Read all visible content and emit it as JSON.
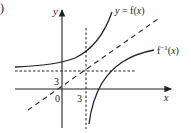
{
  "figure": {
    "part_label": ")",
    "axes": {
      "x_label": "x",
      "y_label": "y",
      "origin_label": "0"
    },
    "ticks": {
      "x_tick": "3",
      "y_tick": "3"
    },
    "curves": {
      "f_label": "y = f(x)",
      "finv_label_base": "f",
      "finv_label_sup": "−1",
      "finv_label_arg": "(x)"
    },
    "reference_line": "y = x (dashed)",
    "asymptotes": {
      "horizontal": "y = 3 (dashed)",
      "vertical": "x = 3 (dashed)"
    },
    "colors": {
      "ink": "#222222",
      "background": "#ffffff"
    }
  }
}
